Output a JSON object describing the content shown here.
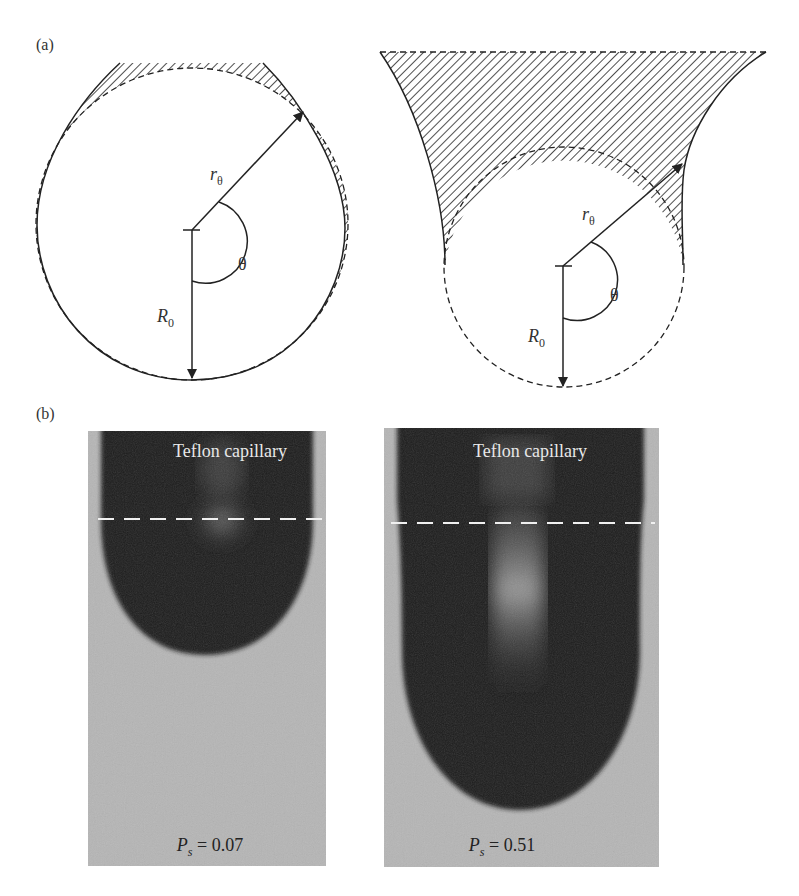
{
  "figure": {
    "panel_a": {
      "label": "(a)",
      "left_diagram": {
        "r_label": "r",
        "r_sub": "θ",
        "theta_label": "θ",
        "R_label": "R",
        "R_sub": "0"
      },
      "right_diagram": {
        "r_label": "r",
        "r_sub": "θ",
        "theta_label": "θ",
        "R_label": "R",
        "R_sub": "0"
      }
    },
    "panel_b": {
      "label": "(b)",
      "left_photo": {
        "caption": "Teflon capillary",
        "ps_symbol": "P",
        "ps_sub": "s",
        "ps_value": "= 0.07"
      },
      "right_photo": {
        "caption": "Teflon capillary",
        "ps_symbol": "P",
        "ps_sub": "s",
        "ps_value": "= 0.51"
      }
    },
    "colors": {
      "line": "#222222",
      "photo_background": "#b5b5b5",
      "drop": "#1e1e1e",
      "dashed_marker": "#f0f0f0"
    }
  }
}
